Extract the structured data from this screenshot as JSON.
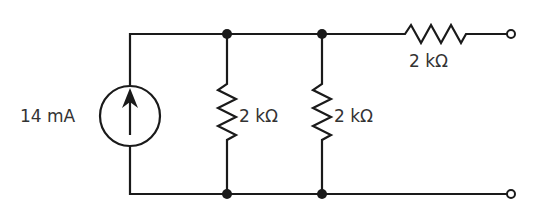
{
  "diagram": {
    "type": "circuit-schematic",
    "source": {
      "kind": "current-source",
      "value": "14 mA",
      "direction": "up"
    },
    "resistors": [
      {
        "id": "R1",
        "value": "2 kΩ",
        "orientation": "vertical",
        "position": "shunt-1"
      },
      {
        "id": "R2",
        "value": "2 kΩ",
        "orientation": "vertical",
        "position": "shunt-2"
      },
      {
        "id": "R3",
        "value": "2 kΩ",
        "orientation": "horizontal",
        "position": "series-output"
      }
    ],
    "nodes": 4,
    "terminals": 2
  },
  "colors": {
    "wire": "#1a1a1a",
    "label": "#333333",
    "background": "#ffffff"
  }
}
